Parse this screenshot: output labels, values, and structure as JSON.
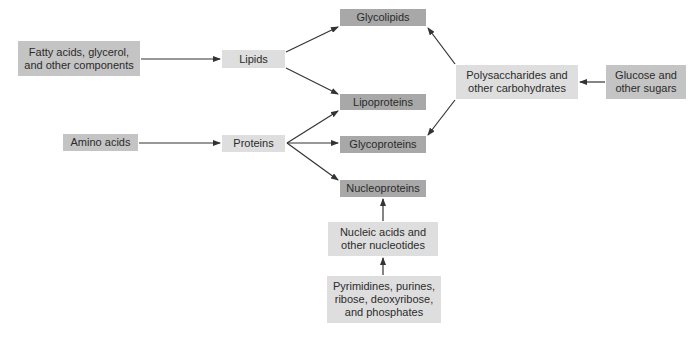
{
  "diagram": {
    "nodes": {
      "fatty_acids": "Fatty acids, glycerol,\nand other components",
      "lipids": "Lipids",
      "glycolipids": "Glycolipids",
      "lipoproteins": "Lipoproteins",
      "glycoproteins": "Glycoproteins",
      "nucleoproteins": "Nucleoproteins",
      "amino_acids": "Amino acids",
      "proteins": "Proteins",
      "polysaccharides": "Polysaccharides and\nother carbohydrates",
      "glucose": "Glucose and\nother sugars",
      "nucleic_acids": "Nucleic acids and\nother nucleotides",
      "pyrimidines": "Pyrimidines, purines,\nribose, deoxyribose,\nand phosphates"
    },
    "edges": [
      {
        "from": "fatty_acids",
        "to": "lipids"
      },
      {
        "from": "lipids",
        "to": "glycolipids"
      },
      {
        "from": "lipids",
        "to": "lipoproteins"
      },
      {
        "from": "amino_acids",
        "to": "proteins"
      },
      {
        "from": "proteins",
        "to": "lipoproteins"
      },
      {
        "from": "proteins",
        "to": "glycoproteins"
      },
      {
        "from": "proteins",
        "to": "nucleoproteins"
      },
      {
        "from": "glucose",
        "to": "polysaccharides"
      },
      {
        "from": "polysaccharides",
        "to": "glycolipids"
      },
      {
        "from": "polysaccharides",
        "to": "glycoproteins"
      },
      {
        "from": "nucleic_acids",
        "to": "nucleoproteins"
      },
      {
        "from": "pyrimidines",
        "to": "nucleic_acids"
      }
    ],
    "colors": {
      "dark_box": "#a8a8a8",
      "mid_box": "#c4c4c4",
      "light_box": "#dedede",
      "arrow": "#333333"
    }
  }
}
